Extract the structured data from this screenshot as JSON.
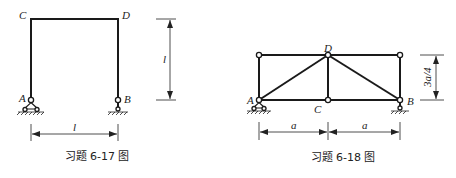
{
  "figures": [
    {
      "id": "6-17",
      "caption": "习题 6-17 图",
      "labels": {
        "A": "A",
        "B": "B",
        "C": "C",
        "D": "D"
      },
      "dimensions": {
        "height": "l",
        "span": "l"
      },
      "description": "Portal frame C-D with pinned support at A and roller at B"
    },
    {
      "id": "6-18",
      "caption": "习题 6-18 图",
      "labels": {
        "A": "A",
        "B": "B",
        "C": "C",
        "D": "D"
      },
      "dimensions": {
        "height": "3a/4",
        "span_left": "a",
        "span_right": "a"
      },
      "description": "Truss with pinned support at A and roller at B"
    }
  ]
}
